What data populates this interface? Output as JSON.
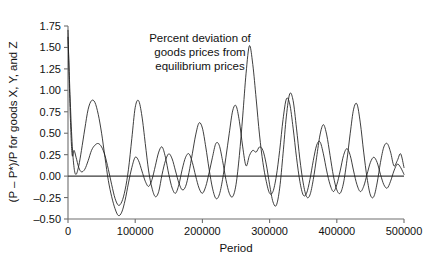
{
  "chart_data": {
    "type": "line",
    "title": "",
    "annotation": "Percent deviation of\ngoods prices from\nequilibrium prices",
    "annotation_lines": [
      "Percent deviation of",
      "goods prices from",
      "equilibrium prices"
    ],
    "xlabel": "Period",
    "ylabel": "(P – P*)/P for goods X, Y, and Z",
    "xlim": [
      0,
      500000
    ],
    "ylim": [
      -0.5,
      1.75
    ],
    "xticks": [
      0,
      100000,
      200000,
      300000,
      400000,
      500000
    ],
    "xtick_labels": [
      "0",
      "100000",
      "200000",
      "300000",
      "400000",
      "500000"
    ],
    "yticks": [
      -0.5,
      -0.25,
      0.0,
      0.25,
      0.5,
      0.75,
      1.0,
      1.25,
      1.5,
      1.75
    ],
    "ytick_labels": [
      "-0.50",
      "-0.25",
      "0.00",
      "0.25",
      "0.50",
      "0.75",
      "1.00",
      "1.25",
      "1.50",
      "1.75"
    ],
    "grid": false,
    "legend": null,
    "zero_reference_line": 0.0,
    "series": [
      {
        "name": "goods X, Y, and Z deviation (series A)",
        "color": "#1c1c1c",
        "x": [
          0,
          3000,
          6000,
          9000,
          12000,
          16000,
          20000,
          25000,
          30000,
          35000,
          40000,
          45000,
          50000,
          55000,
          60000,
          65000,
          70000,
          75000,
          80000,
          85000,
          90000,
          95000,
          100000,
          105000,
          110000,
          115000,
          120000,
          125000,
          130000,
          135000,
          140000,
          145000,
          150000,
          155000,
          160000,
          165000,
          170000,
          175000,
          180000,
          185000,
          190000,
          195000,
          200000,
          205000,
          210000,
          215000,
          220000,
          225000,
          230000,
          235000,
          240000,
          245000,
          250000,
          255000,
          260000,
          265000,
          270000,
          275000,
          280000,
          285000,
          290000,
          295000,
          300000,
          305000,
          310000,
          315000,
          320000,
          325000,
          330000,
          335000,
          340000,
          345000,
          350000,
          355000,
          360000,
          365000,
          370000,
          375000,
          380000,
          385000,
          390000,
          395000,
          400000,
          405000,
          410000,
          415000,
          420000,
          425000,
          430000,
          435000,
          440000,
          445000,
          450000,
          455000,
          460000,
          465000,
          470000,
          475000,
          480000,
          485000,
          490000,
          495000,
          500000
        ],
        "y": [
          1.62,
          0.95,
          0.4,
          0.1,
          0.02,
          0.12,
          0.3,
          0.55,
          0.78,
          0.88,
          0.86,
          0.72,
          0.5,
          0.22,
          -0.05,
          -0.24,
          -0.38,
          -0.46,
          -0.42,
          -0.28,
          -0.08,
          0.1,
          0.22,
          0.18,
          0.06,
          -0.06,
          -0.12,
          -0.04,
          0.12,
          0.28,
          0.34,
          0.22,
          0.02,
          -0.14,
          -0.2,
          -0.1,
          0.08,
          0.22,
          0.26,
          0.16,
          0.0,
          -0.14,
          -0.2,
          -0.12,
          0.04,
          0.22,
          0.38,
          0.36,
          0.18,
          -0.04,
          -0.2,
          -0.24,
          -0.1,
          0.24,
          0.7,
          1.2,
          1.52,
          1.3,
          0.9,
          0.48,
          0.16,
          -0.06,
          -0.2,
          -0.18,
          0.0,
          0.3,
          0.66,
          0.9,
          0.84,
          0.56,
          0.22,
          -0.06,
          -0.22,
          -0.2,
          -0.04,
          0.18,
          0.36,
          0.4,
          0.26,
          0.06,
          -0.1,
          -0.18,
          -0.1,
          0.06,
          0.24,
          0.32,
          0.24,
          0.06,
          -0.1,
          -0.18,
          -0.12,
          0.02,
          0.16,
          0.22,
          0.16,
          0.02,
          -0.1,
          -0.14,
          -0.06,
          0.06,
          0.14,
          0.1,
          0.02
        ]
      },
      {
        "name": "goods X, Y, and Z deviation (series B)",
        "color": "#1c1c1c",
        "x": [
          0,
          3000,
          6000,
          9000,
          12000,
          16000,
          20000,
          25000,
          30000,
          35000,
          40000,
          45000,
          50000,
          55000,
          60000,
          65000,
          70000,
          75000,
          80000,
          85000,
          90000,
          95000,
          100000,
          105000,
          110000,
          115000,
          120000,
          125000,
          130000,
          135000,
          140000,
          145000,
          150000,
          155000,
          160000,
          165000,
          170000,
          175000,
          180000,
          185000,
          190000,
          195000,
          200000,
          205000,
          210000,
          215000,
          220000,
          225000,
          230000,
          235000,
          240000,
          245000,
          250000,
          255000,
          260000,
          265000,
          270000,
          275000,
          280000,
          285000,
          290000,
          295000,
          300000,
          305000,
          310000,
          315000,
          320000,
          325000,
          330000,
          335000,
          340000,
          345000,
          350000,
          355000,
          360000,
          365000,
          370000,
          375000,
          380000,
          385000,
          390000,
          395000,
          400000,
          405000,
          410000,
          415000,
          420000,
          425000,
          430000,
          435000,
          440000,
          445000,
          450000,
          455000,
          460000,
          465000,
          470000,
          475000,
          480000,
          485000,
          490000,
          495000,
          500000
        ],
        "y": [
          1.7,
          0.8,
          0.26,
          0.3,
          0.22,
          0.1,
          0.05,
          0.08,
          0.18,
          0.3,
          0.36,
          0.38,
          0.34,
          0.24,
          0.08,
          -0.1,
          -0.26,
          -0.34,
          -0.3,
          -0.16,
          0.08,
          0.44,
          0.8,
          0.88,
          0.7,
          0.38,
          0.06,
          -0.14,
          -0.24,
          -0.18,
          0.02,
          0.18,
          0.26,
          0.2,
          0.06,
          -0.08,
          -0.16,
          -0.12,
          0.04,
          0.26,
          0.48,
          0.62,
          0.56,
          0.34,
          0.08,
          -0.14,
          -0.26,
          -0.22,
          -0.04,
          0.22,
          0.5,
          0.76,
          0.82,
          0.64,
          0.34,
          0.12,
          0.24,
          0.3,
          0.28,
          0.34,
          0.3,
          0.14,
          -0.1,
          -0.3,
          -0.34,
          -0.14,
          0.26,
          0.7,
          0.96,
          0.88,
          0.56,
          0.2,
          -0.08,
          -0.24,
          -0.22,
          -0.04,
          0.22,
          0.48,
          0.6,
          0.48,
          0.24,
          0.0,
          -0.16,
          -0.2,
          -0.08,
          0.18,
          0.5,
          0.78,
          0.84,
          0.62,
          0.28,
          -0.02,
          -0.22,
          -0.24,
          -0.08,
          0.16,
          0.34,
          0.38,
          0.28,
          0.12,
          0.18,
          0.26,
          0.1
        ]
      }
    ]
  }
}
